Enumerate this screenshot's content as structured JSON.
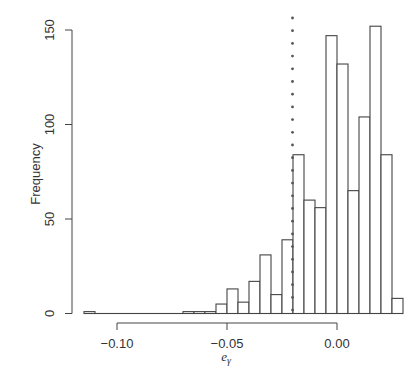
{
  "chart_data": {
    "type": "bar",
    "title": "",
    "xlabel": "e_γ",
    "ylabel": "Frequency",
    "xlim": [
      -0.115,
      0.03
    ],
    "ylim": [
      0,
      150
    ],
    "xticks": [
      "-0.10",
      "-0.05",
      "0.00"
    ],
    "yticks": [
      "0",
      "50",
      "100",
      "150"
    ],
    "grid": false,
    "bin_width": 0.005,
    "bins": [
      {
        "x0": -0.115,
        "x1": -0.11,
        "count": 1
      },
      {
        "x0": -0.11,
        "x1": -0.105,
        "count": 0
      },
      {
        "x0": -0.105,
        "x1": -0.1,
        "count": 0
      },
      {
        "x0": -0.1,
        "x1": -0.095,
        "count": 0
      },
      {
        "x0": -0.095,
        "x1": -0.09,
        "count": 0
      },
      {
        "x0": -0.09,
        "x1": -0.085,
        "count": 0
      },
      {
        "x0": -0.085,
        "x1": -0.08,
        "count": 0
      },
      {
        "x0": -0.08,
        "x1": -0.075,
        "count": 0
      },
      {
        "x0": -0.075,
        "x1": -0.07,
        "count": 0
      },
      {
        "x0": -0.07,
        "x1": -0.065,
        "count": 1
      },
      {
        "x0": -0.065,
        "x1": -0.06,
        "count": 1
      },
      {
        "x0": -0.06,
        "x1": -0.055,
        "count": 1
      },
      {
        "x0": -0.055,
        "x1": -0.05,
        "count": 5
      },
      {
        "x0": -0.05,
        "x1": -0.045,
        "count": 13
      },
      {
        "x0": -0.045,
        "x1": -0.04,
        "count": 6
      },
      {
        "x0": -0.04,
        "x1": -0.035,
        "count": 17
      },
      {
        "x0": -0.035,
        "x1": -0.03,
        "count": 31
      },
      {
        "x0": -0.03,
        "x1": -0.025,
        "count": 10
      },
      {
        "x0": -0.025,
        "x1": -0.02,
        "count": 39
      },
      {
        "x0": -0.02,
        "x1": -0.015,
        "count": 84
      },
      {
        "x0": -0.015,
        "x1": -0.01,
        "count": 60
      },
      {
        "x0": -0.01,
        "x1": -0.005,
        "count": 56
      },
      {
        "x0": -0.005,
        "x1": 0.0,
        "count": 147
      },
      {
        "x0": 0.0,
        "x1": 0.005,
        "count": 132
      },
      {
        "x0": 0.005,
        "x1": 0.01,
        "count": 65
      },
      {
        "x0": 0.01,
        "x1": 0.015,
        "count": 104
      },
      {
        "x0": 0.015,
        "x1": 0.02,
        "count": 152
      },
      {
        "x0": 0.02,
        "x1": 0.025,
        "count": 84
      },
      {
        "x0": 0.025,
        "x1": 0.03,
        "count": 8
      }
    ],
    "annotations": [
      {
        "type": "vertical-dotted-line",
        "x": -0.02
      }
    ]
  },
  "axes": {
    "ylabel": "Frequency",
    "xlabel_main": "e",
    "xlabel_sub": "γ"
  },
  "colors": {
    "bar_fill": "#ffffff",
    "bar_stroke": "#444444",
    "axis": "#444444",
    "dotted_line": "#555555"
  }
}
